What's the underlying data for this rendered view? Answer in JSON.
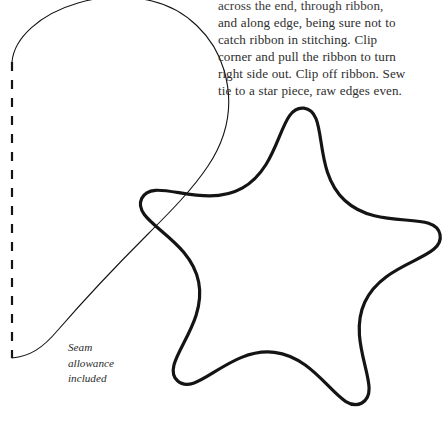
{
  "page": {
    "background_color": "#ffffff",
    "ink_color": "#141414",
    "text_color": "#2e2e2e",
    "width": 444,
    "height": 440
  },
  "instructions": {
    "lines": [
      "across the end, through ribbon,",
      "and along edge, being sure not to",
      "catch ribbon in stitching. Clip",
      "corner and pull the ribbon to turn",
      "right side out. Clip off ribbon. Sew",
      "tie to a star piece, raw edges even."
    ]
  },
  "seam_note": {
    "lines": [
      "Seam",
      "allowance",
      "included"
    ]
  },
  "pattern": {
    "tie_piece": {
      "label": "tie-piece-outline",
      "stroke_color": "#141414",
      "stroke_width": 1.1,
      "fold_line": {
        "label": "fold-line-dashed",
        "stroke_color": "#141414",
        "stroke_width": 2.2,
        "dash": "9 9",
        "x": 12,
        "y_start": 62,
        "y_end": 358
      }
    },
    "star_piece": {
      "label": "star-outline",
      "stroke_color": "#141414",
      "stroke_width": 3.2,
      "points": 5
    }
  }
}
